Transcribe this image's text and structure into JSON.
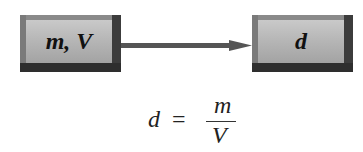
{
  "diagram": {
    "input_box": {
      "label": "m, V"
    },
    "output_box": {
      "label": "d"
    },
    "arrow": {
      "direction": "right"
    },
    "formula": {
      "lhs": "d",
      "equals": "=",
      "numerator": "m",
      "denominator": "V"
    }
  }
}
